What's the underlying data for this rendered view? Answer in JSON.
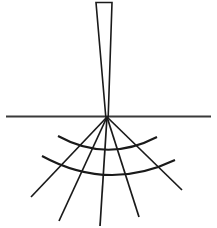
{
  "figure": {
    "title": "",
    "caption": "",
    "background_color": "#ffffff",
    "stroke_color": "#1a1a1a",
    "surface_line": {
      "label": "surface-line",
      "x1": 6,
      "y1": 116.5,
      "x2": 211,
      "y2": 116.5,
      "stroke_width": 2.0,
      "color": "#3a3a3a"
    },
    "needle": {
      "label": "needle-wedge",
      "top_left_x": 96,
      "top_right_x": 112,
      "top_y": 2.5,
      "tip_x": 107,
      "tip_y": 117,
      "stroke_width": 1.6,
      "color": "#1a1a1a",
      "points": "96,2.5 112,2.5 108.2,117 105.8,117"
    },
    "apex": {
      "label": "fan-apex",
      "x": 107,
      "y": 117
    },
    "radial_lines": [
      {
        "label": "radial-line-1",
        "x1": 107,
        "y1": 117,
        "x2": 31,
        "y2": 197,
        "stroke_width": 1.7
      },
      {
        "label": "radial-line-2",
        "x1": 107,
        "y1": 117,
        "x2": 59,
        "y2": 221,
        "stroke_width": 1.7
      },
      {
        "label": "radial-line-3",
        "x1": 107,
        "y1": 117,
        "x2": 100,
        "y2": 226,
        "stroke_width": 1.7
      },
      {
        "label": "radial-line-4",
        "x1": 107,
        "y1": 117,
        "x2": 139,
        "y2": 217,
        "stroke_width": 1.7
      },
      {
        "label": "radial-line-5",
        "x1": 107,
        "y1": 117,
        "x2": 182,
        "y2": 190,
        "stroke_width": 1.7
      }
    ],
    "arcs": [
      {
        "label": "inner-arc",
        "start_x": 58,
        "start_y": 136,
        "end_x": 157,
        "end_y": 137,
        "control_x": 107,
        "control_y": 163,
        "stroke_width": 2.0
      },
      {
        "label": "outer-arc",
        "start_x": 42,
        "start_y": 156,
        "end_x": 175,
        "end_y": 160,
        "control_x": 108,
        "control_y": 192,
        "stroke_width": 2.0
      }
    ]
  }
}
